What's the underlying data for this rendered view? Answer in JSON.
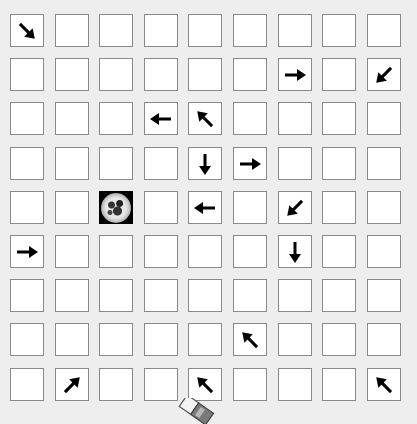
{
  "board": {
    "rows": 9,
    "cols": 9,
    "origin_x": 10,
    "origin_y": 14,
    "pitch_x": 44.6,
    "pitch_y": 44.2,
    "background_color": "#eeeeee",
    "cell_color": "#ffffff",
    "arrow_color": "#000000",
    "cells": [
      [
        "down-right",
        "",
        "",
        "",
        "",
        "",
        "",
        "",
        ""
      ],
      [
        "",
        "",
        "",
        "",
        "",
        "",
        "right",
        "",
        "down-left"
      ],
      [
        "",
        "",
        "",
        "left",
        "up-left",
        "",
        "",
        "",
        ""
      ],
      [
        "",
        "",
        "",
        "",
        "down",
        "right",
        "",
        "",
        ""
      ],
      [
        "",
        "",
        "globe",
        "",
        "left",
        "",
        "down-left",
        "",
        ""
      ],
      [
        "right",
        "",
        "",
        "",
        "",
        "",
        "down",
        "",
        ""
      ],
      [
        "",
        "",
        "",
        "",
        "",
        "",
        "",
        "",
        ""
      ],
      [
        "",
        "",
        "",
        "",
        "",
        "up-left",
        "",
        "",
        ""
      ],
      [
        "",
        "up-right",
        "",
        "",
        "up-left",
        "",
        "",
        "",
        "up-left"
      ]
    ]
  },
  "icons": {
    "globe": "globe-icon",
    "eraser": "eraser-icon"
  }
}
